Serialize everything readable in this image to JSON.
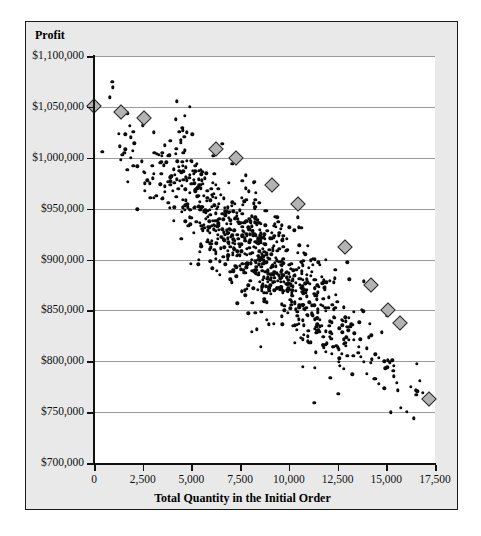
{
  "chart_data": {
    "type": "scatter",
    "title": "",
    "xlabel": "Total Quantity in the Initial Order",
    "ylabel": "Profit",
    "xlim": [
      0,
      17500
    ],
    "ylim": [
      700000,
      1100000
    ],
    "grid": true,
    "legend": false,
    "x_ticks": [
      0,
      2500,
      5000,
      7500,
      10000,
      12500,
      15000,
      17500
    ],
    "x_tick_labels": [
      "0",
      "2,500",
      "5,000",
      "7,500",
      "10,000",
      "12,500",
      "15,000",
      "17,500"
    ],
    "y_ticks": [
      700000,
      750000,
      800000,
      850000,
      900000,
      950000,
      1000000,
      1050000,
      1100000
    ],
    "y_tick_labels": [
      "$700,000",
      "$750,000",
      "$800,000",
      "$850,000",
      "$900,000",
      "$950,000",
      "$1,000,000",
      "$1,050,000",
      "$1,100,000"
    ],
    "series": [
      {
        "name": "simulated-outcomes",
        "marker": "filled-circle",
        "color": "#0b0b0b",
        "count": 900,
        "description": "Dense negatively-sloped elliptical cloud of simulated profit outcomes",
        "cloud": {
          "x_min": 300,
          "x_max": 17000,
          "slope_per_unit": -17.0,
          "intercept": 1047000,
          "residual_sd": 27000,
          "x_center": 8200,
          "x_sd": 3300
        }
      },
      {
        "name": "efficient-frontier",
        "marker": "grey-diamond",
        "color": "#b3b3b3",
        "points": [
          {
            "x": 0,
            "y": 1051000
          },
          {
            "x": 1400,
            "y": 1045000
          },
          {
            "x": 2550,
            "y": 1039000
          },
          {
            "x": 6250,
            "y": 1009000
          },
          {
            "x": 7300,
            "y": 1000000
          },
          {
            "x": 9150,
            "y": 973000
          },
          {
            "x": 10450,
            "y": 955000
          },
          {
            "x": 12900,
            "y": 912000
          },
          {
            "x": 14200,
            "y": 875000
          },
          {
            "x": 15100,
            "y": 850000
          },
          {
            "x": 15700,
            "y": 838000
          },
          {
            "x": 17200,
            "y": 763000
          }
        ]
      }
    ]
  },
  "colors": {
    "frame_background": "#e9e9e9",
    "plot_background": "#ffffff",
    "axis": "#111111",
    "gridline": "#9a9a9a",
    "point": "#0b0b0b",
    "diamond_fill": "#b3b3b3",
    "diamond_stroke": "#2a2a2a",
    "frame_border": "#1a1a1a"
  }
}
